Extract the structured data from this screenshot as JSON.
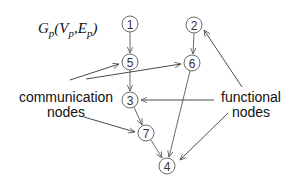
{
  "diagram": {
    "title": {
      "main": "G",
      "main_sub": "p",
      "open": "(V",
      "v_sub": "p",
      "sep": ",E",
      "e_sub": "p",
      "close": ")"
    },
    "nodes": [
      {
        "id": "1",
        "label": "1",
        "type": "functional",
        "cx": 130,
        "cy": 24
      },
      {
        "id": "2",
        "label": "2",
        "type": "functional",
        "cx": 194,
        "cy": 25
      },
      {
        "id": "5",
        "label": "5",
        "type": "communication",
        "cx": 130,
        "cy": 62
      },
      {
        "id": "6",
        "label": "6",
        "type": "communication",
        "cx": 192,
        "cy": 63
      },
      {
        "id": "3",
        "label": "3",
        "type": "functional",
        "cx": 130,
        "cy": 100
      },
      {
        "id": "7",
        "label": "7",
        "type": "communication",
        "cx": 146,
        "cy": 133
      },
      {
        "id": "4",
        "label": "4",
        "type": "functional",
        "cx": 167,
        "cy": 166
      }
    ],
    "edges": [
      {
        "from": "1",
        "to": "5"
      },
      {
        "from": "2",
        "to": "6"
      },
      {
        "from": "5",
        "to": "3"
      },
      {
        "from": "3",
        "to": "7"
      },
      {
        "from": "7",
        "to": "4"
      },
      {
        "from": "6",
        "to": "4"
      }
    ],
    "callouts": {
      "communication": {
        "line1": "communication",
        "line2": "nodes",
        "points_to": [
          "5",
          "6",
          "7"
        ]
      },
      "functional": {
        "line1": "functional",
        "line2": "nodes",
        "points_to": [
          "2",
          "3",
          "4"
        ]
      }
    },
    "colors": {
      "node_stroke": "#6b6b6b",
      "edge": "#6b6b6b",
      "text": "#111111",
      "background": "#ffffff"
    }
  }
}
